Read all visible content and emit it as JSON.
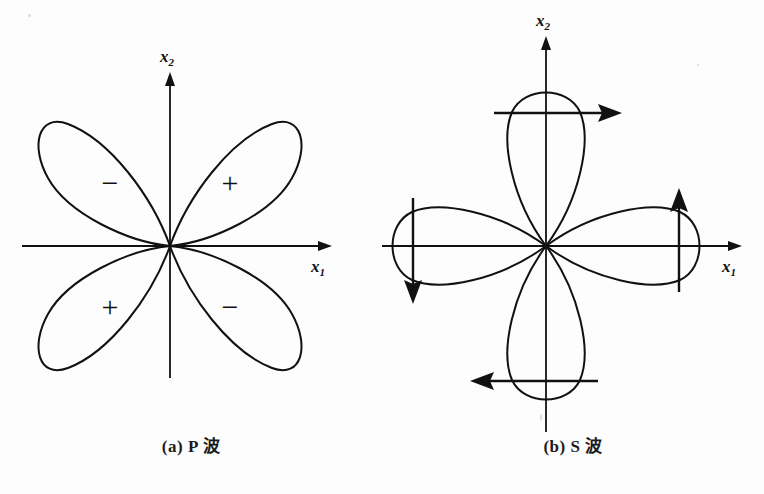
{
  "figure": {
    "background_color": "#fdfdfd",
    "ink_color": "#111111",
    "width": 764,
    "height": 494
  },
  "panels": [
    {
      "id": "p-wave",
      "caption": "(a) P 波",
      "caption_index": "(a)",
      "caption_wave": "P 波",
      "axes": {
        "x_label": "x",
        "x_subscript": "1",
        "y_label": "x",
        "y_subscript": "2",
        "origin": {
          "x": 170,
          "y": 246
        },
        "x_range_px": [
          22,
          325
        ],
        "y_range_px": [
          75,
          378
        ]
      },
      "pattern_type": "four-lobe-diagonal",
      "lobes": [
        {
          "name": "upper-left",
          "angle_deg": 135,
          "sign": "−",
          "sign_x": 110,
          "sign_y": 182,
          "length": 160
        },
        {
          "name": "upper-right",
          "angle_deg": 45,
          "sign": "+",
          "sign_x": 230,
          "sign_y": 182,
          "length": 160
        },
        {
          "name": "lower-left",
          "angle_deg": 225,
          "sign": "+",
          "sign_x": 110,
          "sign_y": 306,
          "length": 160
        },
        {
          "name": "lower-right",
          "angle_deg": 315,
          "sign": "−",
          "sign_x": 230,
          "sign_y": 306,
          "length": 160
        }
      ]
    },
    {
      "id": "s-wave",
      "caption": "(b) S 波",
      "caption_index": "(b)",
      "caption_wave": "S 波",
      "axes": {
        "x_label": "x",
        "x_subscript": "1",
        "y_label": "x",
        "y_subscript": "2",
        "origin": {
          "x": 164,
          "y": 246
        },
        "x_range_px": [
          0,
          353
        ],
        "y_range_px": [
          38,
          432
        ]
      },
      "pattern_type": "four-lobe-axial",
      "lobes": [
        {
          "name": "top",
          "angle_deg": 90,
          "length": 150,
          "arrow": "right",
          "arrow_label": "tangential-motion-arrow-top"
        },
        {
          "name": "bottom",
          "angle_deg": 270,
          "length": 150,
          "arrow": "left",
          "arrow_label": "tangential-motion-arrow-bottom"
        },
        {
          "name": "left",
          "angle_deg": 180,
          "length": 150,
          "arrow": "down",
          "arrow_label": "tangential-motion-arrow-left"
        },
        {
          "name": "right",
          "angle_deg": 0,
          "length": 150,
          "arrow": "up",
          "arrow_label": "tangential-motion-arrow-right"
        }
      ]
    }
  ]
}
